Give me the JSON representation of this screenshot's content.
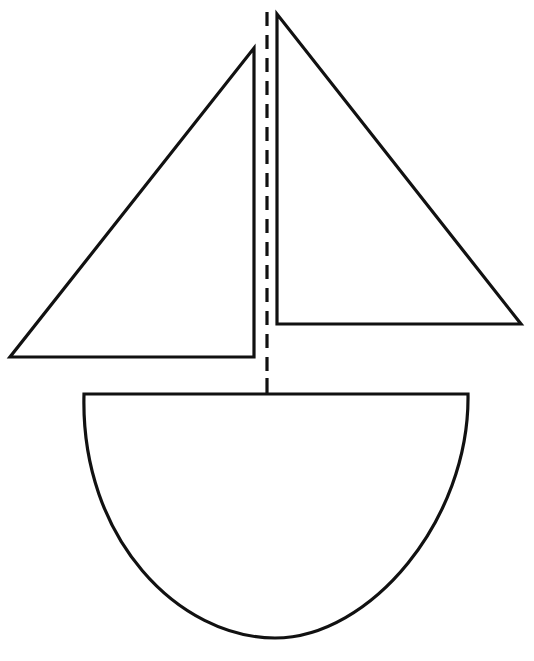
{
  "figure": {
    "colors": {
      "background": "#ffffff",
      "stroke": "#111111"
    },
    "shapes": {
      "left_sail": {
        "points": "10,357 254,357 254,48"
      },
      "right_sail": {
        "points": "277,14 277,324 521,324"
      },
      "mast": {
        "x": 267,
        "y1": 12,
        "y2": 380,
        "style": "dashed"
      },
      "mast_base": {
        "x": 267,
        "y1": 378,
        "y2": 394
      },
      "hull": {
        "path": "M 84 394 L 468 394 C 470 520, 370 638, 275 638 C 180 638, 80 540, 84 394 Z"
      }
    }
  }
}
